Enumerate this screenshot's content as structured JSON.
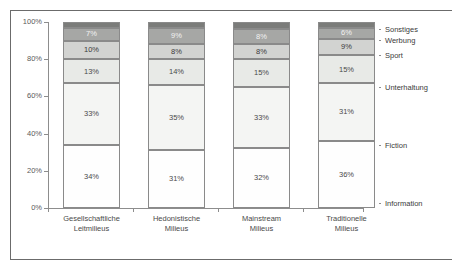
{
  "chart_data": {
    "type": "bar",
    "stacked": true,
    "normalized": true,
    "title": "",
    "subtitle": "",
    "xlabel": "",
    "ylabel": "",
    "ylim": [
      0,
      100
    ],
    "ytick_labels": [
      "0%",
      "20%",
      "40%",
      "60%",
      "80%",
      "100%"
    ],
    "ytick_values": [
      0,
      20,
      40,
      60,
      80,
      100
    ],
    "grid": false,
    "legend_position": "right",
    "categories": [
      "Gesellschaftliche Leitmilieus",
      "Hedonistische Milieus",
      "Mainstream Milieus",
      "Traditionelle Milieus"
    ],
    "category_lines": [
      [
        "Gesellschaftliche",
        "Leitmilieus"
      ],
      [
        "Hedonistische",
        "Milieus"
      ],
      [
        "Mainstream",
        "Milieus"
      ],
      [
        "Traditionelle",
        "Milieus"
      ]
    ],
    "series": [
      {
        "name": "Information",
        "values": [
          34,
          31,
          32,
          36
        ],
        "labels": [
          "34%",
          "31%",
          "32%",
          "36%"
        ],
        "color": "#fefefe",
        "label_color": "#4a4a4a"
      },
      {
        "name": "Fiction",
        "values": [
          33,
          35,
          33,
          31
        ],
        "labels": [
          "33%",
          "35%",
          "33%",
          "31%"
        ],
        "color": "#f4f5f3",
        "label_color": "#4a4a4a"
      },
      {
        "name": "Unterhaltung",
        "values": [
          13,
          14,
          15,
          15
        ],
        "labels": [
          "13%",
          "14%",
          "15%",
          "15%"
        ],
        "color": "#e8eae7",
        "label_color": "#4a4a4a"
      },
      {
        "name": "Sport",
        "values": [
          10,
          8,
          8,
          9
        ],
        "labels": [
          "10%",
          "8%",
          "8%",
          "9%"
        ],
        "color": "#d2d3d1",
        "label_color": "#3a3a3a"
      },
      {
        "name": "Werbung",
        "values": [
          7,
          9,
          8,
          6
        ],
        "labels": [
          "7%",
          "9%",
          "8%",
          "6%"
        ],
        "color": "#a6a7a5",
        "label_color": "#f2f2f2"
      },
      {
        "name": "Sonstiges",
        "values": [
          3,
          3,
          4,
          3
        ],
        "labels": [
          "",
          "",
          "",
          ""
        ],
        "color": "#7b7c7a",
        "label_color": "#f2f2f2"
      }
    ],
    "legend_entries": [
      {
        "label": "Sonstiges"
      },
      {
        "label": "Werbung"
      },
      {
        "label": "Sport"
      },
      {
        "label": "Unterhaltung"
      },
      {
        "label": "Fiction"
      },
      {
        "label": "Information"
      }
    ]
  }
}
